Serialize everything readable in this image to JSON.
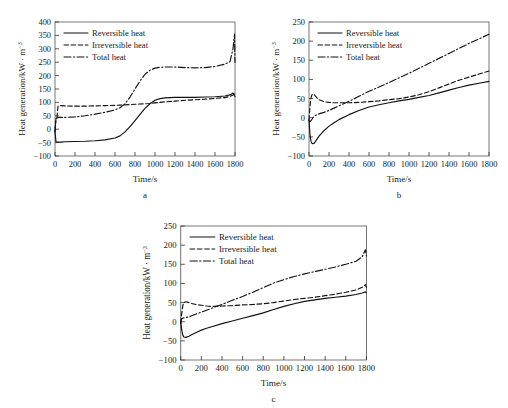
{
  "figure": {
    "panels": [
      {
        "id": "a",
        "letter": "a"
      },
      {
        "id": "b",
        "letter": "b"
      },
      {
        "id": "c",
        "letter": "c"
      }
    ],
    "axis": {
      "xlabel": "Time/s",
      "ylabel_main": "Heat generation/kW",
      "ylabel_mid": " · m",
      "ylabel_sup": "−3"
    },
    "legend": {
      "reversible": "Reversible heat",
      "irreversible": "Irreversible heat",
      "total": "Total heat"
    }
  },
  "chart_data": [
    {
      "id": "a",
      "type": "line",
      "title": "a",
      "xlabel": "Time/s",
      "ylabel": "Heat generation/kW·m⁻³",
      "xlim": [
        0,
        1800
      ],
      "ylim": [
        -100,
        400
      ],
      "xticks": [
        0,
        200,
        400,
        600,
        800,
        1000,
        1200,
        1400,
        1600,
        1800
      ],
      "yticks": [
        -100,
        -50,
        0,
        50,
        100,
        150,
        200,
        250,
        300,
        350,
        400
      ],
      "grid": false,
      "legend_position": "upper-left",
      "x": [
        0,
        10,
        20,
        30,
        40,
        60,
        100,
        200,
        300,
        400,
        500,
        600,
        650,
        700,
        750,
        800,
        850,
        900,
        950,
        1000,
        1050,
        1100,
        1200,
        1300,
        1400,
        1500,
        1600,
        1700,
        1750,
        1780,
        1795,
        1800
      ],
      "series": [
        {
          "name": "Reversible heat",
          "style": "solid",
          "values": [
            -10,
            -47,
            -48,
            -48,
            -48,
            -48,
            -47,
            -46,
            -45,
            -43,
            -40,
            -33,
            -25,
            -10,
            10,
            32,
            55,
            78,
            95,
            108,
            114,
            117,
            119,
            119,
            119,
            120,
            121,
            124,
            128,
            135,
            125,
            122
          ]
        },
        {
          "name": "Irreversible heat",
          "style": "dashed",
          "values": [
            -8,
            40,
            44,
            86,
            88,
            88,
            87,
            86,
            86,
            87,
            88,
            89,
            90,
            91,
            92,
            93,
            94,
            95,
            96,
            98,
            100,
            102,
            105,
            108,
            110,
            112,
            115,
            118,
            122,
            128,
            132,
            126
          ]
        },
        {
          "name": "Total heat",
          "style": "dash-dot",
          "values": [
            -10,
            40,
            42,
            43,
            44,
            44,
            44,
            46,
            50,
            56,
            63,
            72,
            80,
            95,
            120,
            150,
            180,
            205,
            220,
            228,
            231,
            232,
            232,
            230,
            229,
            230,
            234,
            243,
            252,
            300,
            355,
            250
          ]
        }
      ]
    },
    {
      "id": "b",
      "type": "line",
      "title": "b",
      "xlabel": "Time/s",
      "ylabel": "Heat generation/kW·m⁻³",
      "xlim": [
        0,
        1800
      ],
      "ylim": [
        -100,
        250
      ],
      "xticks": [
        0,
        200,
        400,
        600,
        800,
        1000,
        1200,
        1400,
        1600,
        1800
      ],
      "yticks": [
        -100,
        -50,
        0,
        50,
        100,
        150,
        200,
        250
      ],
      "grid": false,
      "legend_position": "upper-left",
      "x": [
        0,
        10,
        20,
        30,
        40,
        50,
        60,
        80,
        100,
        150,
        200,
        250,
        300,
        400,
        500,
        600,
        700,
        800,
        900,
        1000,
        1100,
        1200,
        1300,
        1400,
        1500,
        1600,
        1700,
        1800
      ],
      "series": [
        {
          "name": "Reversible heat",
          "style": "solid",
          "values": [
            -5,
            -45,
            -62,
            -67,
            -68,
            -67,
            -64,
            -56,
            -48,
            -34,
            -22,
            -13,
            -5,
            8,
            19,
            28,
            34,
            39,
            44,
            48,
            53,
            58,
            65,
            72,
            79,
            85,
            90,
            95
          ]
        },
        {
          "name": "Irreversible heat",
          "style": "dashed",
          "values": [
            -6,
            30,
            52,
            60,
            62,
            61,
            58,
            52,
            47,
            42,
            40,
            39,
            39,
            39,
            40,
            42,
            44,
            47,
            50,
            54,
            60,
            68,
            78,
            88,
            98,
            106,
            114,
            122
          ]
        },
        {
          "name": "Total heat",
          "style": "dash-dot",
          "values": [
            -8,
            -10,
            -8,
            -4,
            0,
            3,
            6,
            8,
            10,
            14,
            19,
            25,
            31,
            43,
            56,
            69,
            80,
            92,
            104,
            116,
            129,
            142,
            155,
            168,
            181,
            194,
            206,
            218
          ]
        }
      ]
    },
    {
      "id": "c",
      "type": "line",
      "title": "c",
      "xlabel": "Time/s",
      "ylabel": "Heat generation/kW·m⁻³",
      "xlim": [
        0,
        1800
      ],
      "ylim": [
        -100,
        250
      ],
      "xticks": [
        0,
        200,
        400,
        600,
        800,
        1000,
        1200,
        1400,
        1600,
        1800
      ],
      "yticks": [
        -100,
        -50,
        0,
        50,
        100,
        150,
        200,
        250
      ],
      "grid": false,
      "legend_position": "upper-left",
      "x": [
        0,
        10,
        20,
        30,
        50,
        80,
        100,
        150,
        200,
        250,
        300,
        400,
        500,
        600,
        700,
        800,
        900,
        1000,
        1100,
        1200,
        1300,
        1400,
        1500,
        1600,
        1700,
        1760,
        1790,
        1800
      ],
      "series": [
        {
          "name": "Reversible heat",
          "style": "solid",
          "values": [
            -2,
            -22,
            -35,
            -40,
            -41,
            -38,
            -35,
            -28,
            -22,
            -17,
            -13,
            -5,
            2,
            9,
            16,
            23,
            32,
            40,
            47,
            53,
            57,
            61,
            64,
            67,
            71,
            75,
            78,
            76
          ]
        },
        {
          "name": "Irreversible heat",
          "style": "dashed",
          "values": [
            -3,
            22,
            42,
            50,
            52,
            50,
            48,
            45,
            43,
            41,
            40,
            41,
            42,
            44,
            45,
            47,
            50,
            54,
            58,
            61,
            64,
            68,
            72,
            77,
            83,
            90,
            97,
            90
          ]
        },
        {
          "name": "Total heat",
          "style": "dash-dot",
          "values": [
            -4,
            8,
            9,
            10,
            11,
            13,
            15,
            20,
            25,
            30,
            35,
            45,
            56,
            66,
            77,
            89,
            101,
            110,
            118,
            125,
            131,
            137,
            143,
            150,
            158,
            170,
            188,
            172
          ]
        }
      ]
    }
  ]
}
